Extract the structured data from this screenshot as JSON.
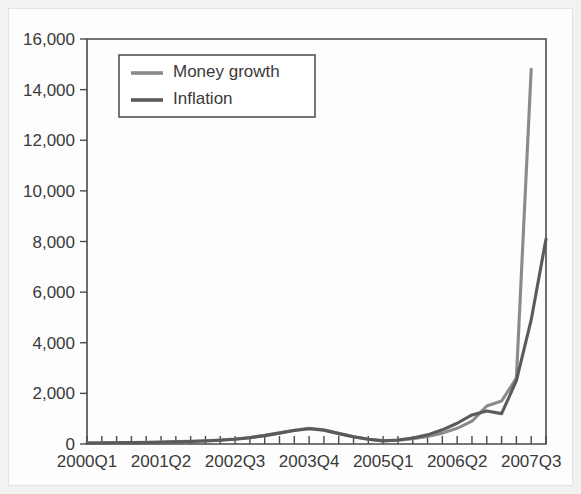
{
  "chart_data": {
    "type": "line",
    "title": "",
    "subtitle": "",
    "xlabel": "",
    "ylabel": "",
    "ylim": [
      0,
      16000
    ],
    "yticks": [
      0,
      2000,
      4000,
      6000,
      8000,
      10000,
      12000,
      14000,
      16000
    ],
    "ytick_labels": [
      "0",
      "2,000",
      "4,000",
      "6,000",
      "8,000",
      "10,000",
      "12,000",
      "14,000",
      "16,000"
    ],
    "grid": false,
    "legend_position": "upper-left-inside",
    "legend_boxed": true,
    "x": [
      "2000Q1",
      "2000Q2",
      "2000Q3",
      "2000Q4",
      "2001Q1",
      "2001Q2",
      "2001Q3",
      "2001Q4",
      "2002Q1",
      "2002Q2",
      "2002Q3",
      "2002Q4",
      "2003Q1",
      "2003Q2",
      "2003Q3",
      "2003Q4",
      "2004Q1",
      "2004Q2",
      "2004Q3",
      "2004Q4",
      "2005Q1",
      "2005Q2",
      "2005Q3",
      "2005Q4",
      "2006Q1",
      "2006Q2",
      "2006Q3",
      "2006Q4",
      "2007Q1",
      "2007Q2",
      "2007Q3",
      "2007Q4"
    ],
    "xtick_labels": [
      "2000Q1",
      "2001Q2",
      "2002Q3",
      "2003Q4",
      "2005Q1",
      "2006Q2",
      "2007Q3"
    ],
    "xtick_indices": [
      0,
      5,
      10,
      15,
      20,
      25,
      30
    ],
    "series": [
      {
        "name": "Money growth",
        "color": "#8a8a8a",
        "values": [
          40,
          45,
          55,
          60,
          70,
          80,
          95,
          110,
          130,
          160,
          200,
          260,
          340,
          440,
          540,
          620,
          560,
          420,
          290,
          190,
          130,
          150,
          210,
          300,
          430,
          620,
          900,
          1500,
          1700,
          2600,
          14800,
          null
        ]
      },
      {
        "name": "Inflation",
        "color": "#5a5a5a",
        "values": [
          35,
          40,
          48,
          55,
          62,
          72,
          85,
          100,
          120,
          150,
          190,
          250,
          330,
          430,
          530,
          600,
          545,
          410,
          285,
          185,
          125,
          160,
          240,
          360,
          560,
          820,
          1150,
          1300,
          1200,
          2500,
          4900,
          8100
        ]
      }
    ]
  }
}
